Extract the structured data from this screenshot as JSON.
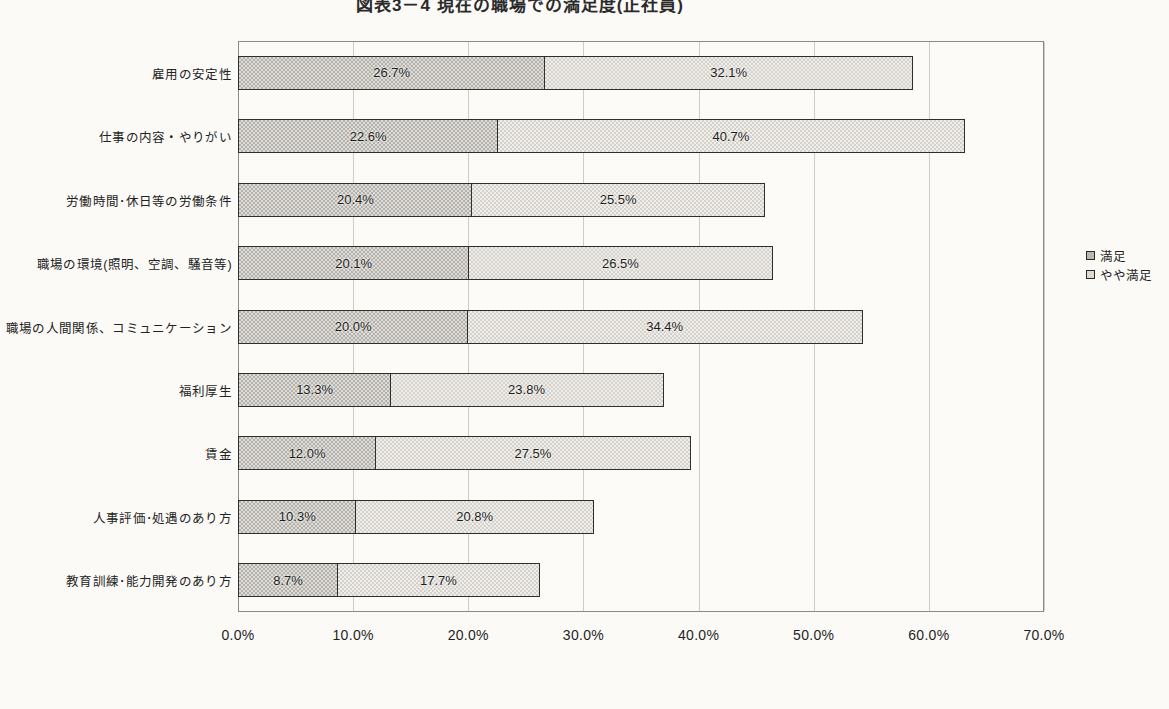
{
  "chart": {
    "title": "図表3－4 現在の職場での満足度(正社員)"
  },
  "legend": {
    "position": "right",
    "items": [
      {
        "label": "満足",
        "swatch": "legend-swatch-satisfied"
      },
      {
        "label": "やや満足",
        "swatch": "legend-swatch-somewhat-satisfied"
      }
    ]
  },
  "axis": {
    "x_ticks": [
      "0.0%",
      "10.0%",
      "20.0%",
      "30.0%",
      "40.0%",
      "50.0%",
      "60.0%",
      "70.0%"
    ]
  },
  "chart_data": {
    "type": "bar",
    "orientation": "horizontal",
    "stacked": true,
    "title": "図表3－4 現在の職場での満足度(正社員)",
    "xlabel": "",
    "ylabel": "",
    "xlim": [
      0,
      70
    ],
    "xtick_values": [
      0,
      10,
      20,
      30,
      40,
      50,
      60,
      70
    ],
    "xtick_labels": [
      "0.0%",
      "10.0%",
      "20.0%",
      "30.0%",
      "40.0%",
      "50.0%",
      "60.0%",
      "70.0%"
    ],
    "grid": true,
    "legend_position": "right",
    "categories": [
      "雇用の安定性",
      "仕事の内容・やりがい",
      "労働時間･休日等の労働条件",
      "職場の環境(照明、空調、騒音等)",
      "職場の人間関係、コミュニケーション",
      "福利厚生",
      "賃金",
      "人事評価･処遇のあり方",
      "教育訓練･能力開発のあり方"
    ],
    "series": [
      {
        "name": "満足",
        "values": [
          26.7,
          22.6,
          20.4,
          20.1,
          20.0,
          13.3,
          12.0,
          10.3,
          8.7
        ],
        "labels": [
          "26.7%",
          "22.6%",
          "20.4%",
          "20.1%",
          "20.0%",
          "13.3%",
          "12.0%",
          "10.3%",
          "8.7%"
        ]
      },
      {
        "name": "やや満足",
        "values": [
          32.1,
          40.7,
          25.5,
          26.5,
          34.4,
          23.8,
          27.5,
          20.8,
          17.7
        ],
        "labels": [
          "32.1%",
          "40.7%",
          "25.5%",
          "26.5%",
          "34.4%",
          "23.8%",
          "27.5%",
          "20.8%",
          "17.7%"
        ]
      }
    ],
    "totals": [
      58.8,
      63.3,
      45.9,
      46.6,
      54.4,
      37.1,
      39.5,
      31.1,
      26.4
    ]
  },
  "colors": {
    "background": "#fbfaf7",
    "plot_background": "#fcfbf8",
    "series_1_fill": "#b3b1aa",
    "series_2_fill": "#d4d2ca",
    "bar_border": "#2e2e2e",
    "gridline": "#cfccc4",
    "axis_border": "#8b8b86",
    "text": "#1f1f1f"
  }
}
